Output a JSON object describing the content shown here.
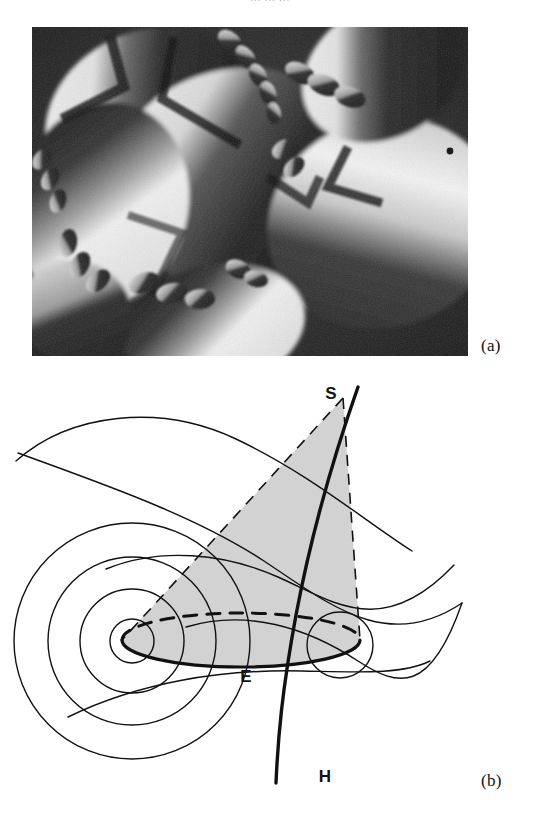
{
  "page": {
    "top_cropped_text": "…  …  …",
    "background": "#ffffff",
    "ink": "#111111"
  },
  "figure": {
    "panels": [
      {
        "id": "a",
        "label": "(a)",
        "type": "micrograph",
        "description": "Grayscale polarized-light micrograph showing large overlapping lenticular (elliptical) domains, each split into bright and dark halves by a dark cross-like extinction seam, surrounded by chains of much smaller similar lens-shaped domains.",
        "frame": {
          "x": 32,
          "y": 27,
          "width": 436,
          "height": 329
        }
      },
      {
        "id": "b",
        "label": "(b)",
        "type": "schematic-diagram",
        "description": "Schematic of a focal conic domain: confocal ellipse E and hyperbola H, cone apex S, shaded cone sector, and traces of the Dupin cyclide layers drawn as nested circles/arcs.",
        "frame": {
          "x": 10,
          "y": 365,
          "width": 470,
          "height": 440
        }
      }
    ]
  },
  "diagram": {
    "labels": [
      {
        "key": "S",
        "text": "S",
        "meaning": "cone-apex-point-on-hyperbola",
        "x": 338,
        "y": 393
      },
      {
        "key": "E",
        "text": "E",
        "meaning": "ellipse",
        "x": 252,
        "y": 676
      },
      {
        "key": "H",
        "text": "H",
        "meaning": "hyperbola",
        "x": 323,
        "y": 776
      }
    ],
    "colors": {
      "stroke": "#111111",
      "shading": "#d2d2d2",
      "background": "#ffffff"
    },
    "strokes": {
      "thick": 3.1,
      "thin": 1.4,
      "dash_pattern": "11 8"
    },
    "ellipse": {
      "center_x": 243,
      "center_y": 634,
      "semi_major": 117,
      "semi_minor": 26,
      "front_half": "solid",
      "back_half": "dashed"
    },
    "layer_traces": {
      "left_nested_circles_radii": [
        22,
        52,
        84,
        118
      ],
      "right_small_circle_radius": 33
    }
  }
}
